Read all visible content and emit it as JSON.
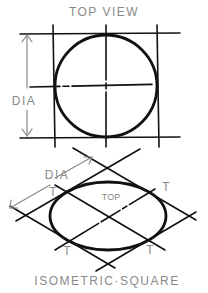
{
  "top_view": {
    "title": "TOP VIEW",
    "dim_label": "DIA"
  },
  "isometric": {
    "dim_label": "DIA",
    "face_label": "TOP",
    "tangent_labels": [
      "T",
      "T",
      "T",
      "T"
    ],
    "caption": "ISOMETRIC·SQUARE"
  },
  "colors": {
    "ink": "#111111",
    "label": "#8a8a8a",
    "background": "#ffffff"
  }
}
